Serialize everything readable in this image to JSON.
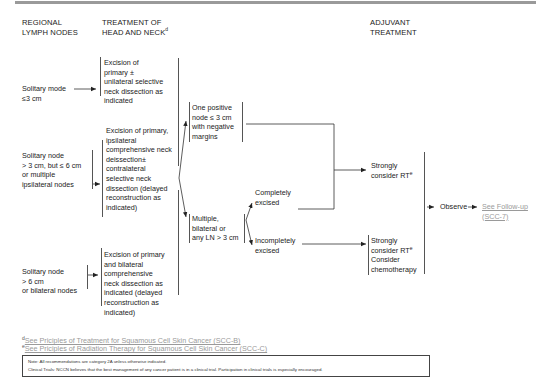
{
  "headers": {
    "col1": [
      "REGIONAL",
      "LYMPH NODES"
    ],
    "col2": [
      "TREATMENT OF",
      "HEAD AND NECK"
    ],
    "col2_sup": "d",
    "col4": [
      "ADJUVANT",
      "TREATMENT"
    ]
  },
  "nodes": {
    "node_small": [
      "Solitary mode",
      "≤3 cm"
    ],
    "node_mid": [
      "Solitary node",
      "> 3 cm, but ≤ 6 cm",
      "or multiple",
      "ipsilateral nodes"
    ],
    "node_large": [
      "Solitary node",
      "> 6 cm",
      "or bilateral nodes"
    ]
  },
  "treatments": {
    "tx_small": [
      "Excision of",
      "primary ±",
      "unilateral selective",
      "neck dissection as",
      "indicated"
    ],
    "tx_mid": [
      "Excision of primary,",
      "ipsilateral",
      "comprehensive neck",
      "deissection±",
      "contralateral",
      "selective neck",
      "dissection (delayed",
      "reconstruction as",
      "indicated)"
    ],
    "tx_large": [
      "Excision of primary",
      "and bilateral",
      "comprehensive",
      "neck dissection as",
      "indicated (delayed",
      "reconstruction as",
      "indicated)"
    ]
  },
  "findings": {
    "one_positive": [
      "One positive",
      "node ≤ 3 cm",
      "with negative",
      "margins"
    ],
    "multiple": [
      "Multiple,",
      "bilateral or",
      "any LN > 3 cm"
    ],
    "completely": [
      "Completely",
      "excised"
    ],
    "incompletely": [
      "Incompletely",
      "excised"
    ]
  },
  "adjuvant": {
    "consider_rt": [
      "Strongly",
      "consider RT"
    ],
    "consider_rt_sup": "e",
    "consider_rt_chemo": [
      "Strongly",
      "consider RT",
      "Consider",
      "chemotherapy"
    ],
    "consider_rt_chemo_sup": "e"
  },
  "outcome": {
    "observe": "Observe",
    "follow_up_link": [
      "See Follow-up",
      "(SCC-7)"
    ]
  },
  "footnotes": {
    "d_marker": "d",
    "d_text": "See Priciples of Treatment for Squamous Cell Skin Cancer (SCC-B)",
    "e_marker": "e",
    "e_text": "See Priciples of Radiation Therapy for Squamous Cell Skin Cancer (SCC-C)"
  },
  "notes": {
    "line1": "Note: All recommendations are category 2A unless otherwise indicated.",
    "line2": "Clinical Trials: NCCN believes that the best management of any cancer patient is in a clinical trial. Participation in clinical trials is especially encouraged."
  }
}
